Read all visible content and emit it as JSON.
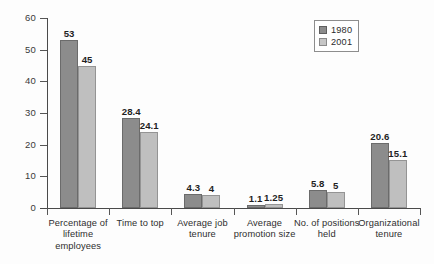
{
  "chart_data": {
    "type": "bar",
    "title": "",
    "subtitle": "",
    "xlabel": "",
    "ylabel": "",
    "ylim": [
      0,
      60
    ],
    "yticks": [
      0,
      10,
      20,
      30,
      40,
      50,
      60
    ],
    "ytick_labels": [
      "0",
      "10",
      "20",
      "30",
      "40",
      "50",
      "60"
    ],
    "grid": false,
    "legend_position": "top-right",
    "categories": [
      "Percentage of lifetime employees",
      "Time to top",
      "Average job tenure",
      "Average promotion size",
      "No. of positions held",
      "Organizational tenure"
    ],
    "category_label_lines": [
      [
        "Percentage of",
        "lifetime",
        "employees"
      ],
      [
        "Time to top"
      ],
      [
        "Average job",
        "tenure"
      ],
      [
        "Average",
        "promotion size"
      ],
      [
        "No. of positions",
        "held"
      ],
      [
        "Organizational",
        "tenure"
      ]
    ],
    "series": [
      {
        "name": "1980",
        "color": "#8c8c8c",
        "values": [
          53,
          28.4,
          4.3,
          1.1,
          5.8,
          20.6
        ],
        "value_labels": [
          "53",
          "28.4",
          "4.3",
          "1.1",
          "5.8",
          "20.6"
        ]
      },
      {
        "name": "2001",
        "color": "#bfbfbf",
        "values": [
          45,
          24.1,
          4,
          1.25,
          5,
          15.1
        ],
        "value_labels": [
          "45",
          "24.1",
          "4",
          "1.25",
          "5",
          "15.1"
        ]
      }
    ]
  },
  "legend": {
    "entries": [
      {
        "label": "1980",
        "swatch": "legend-swatch-1980"
      },
      {
        "label": "2001",
        "swatch": "legend-swatch-2001"
      }
    ]
  }
}
